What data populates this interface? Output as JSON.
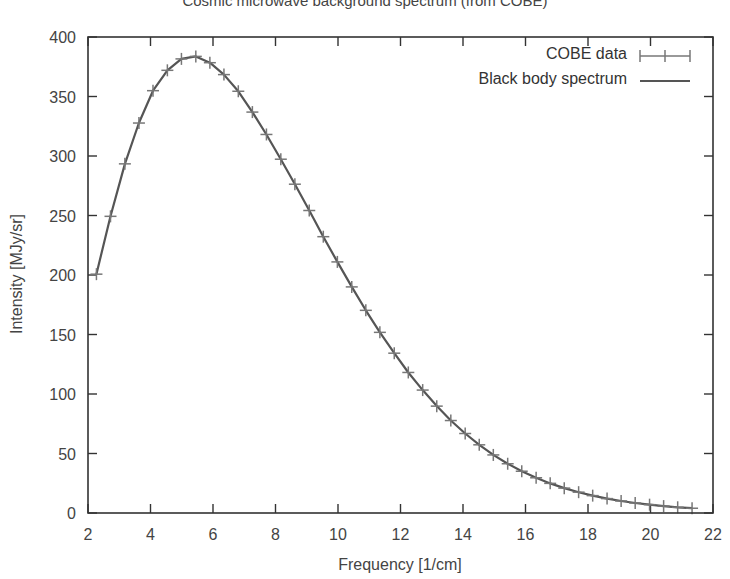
{
  "chart_data": {
    "type": "line",
    "title": "Cosmic microwave background spectrum (from COBE)",
    "xlabel": "Frequency [1/cm]",
    "ylabel": "Intensity [MJy/sr]",
    "xlim": [
      2,
      22
    ],
    "ylim": [
      0,
      400
    ],
    "xticks": [
      2,
      4,
      6,
      8,
      10,
      12,
      14,
      16,
      18,
      20,
      22
    ],
    "yticks": [
      0,
      50,
      100,
      150,
      200,
      250,
      300,
      350,
      400
    ],
    "grid": false,
    "legend_position": "top-right",
    "series": [
      {
        "name": "COBE data",
        "style": "errorbars-crosses",
        "color": "#777777",
        "x": [
          2.27,
          2.72,
          3.18,
          3.63,
          4.08,
          4.54,
          4.99,
          5.45,
          5.9,
          6.35,
          6.81,
          7.26,
          7.71,
          8.17,
          8.62,
          9.08,
          9.53,
          9.98,
          10.44,
          10.89,
          11.34,
          11.8,
          12.25,
          12.71,
          13.16,
          13.61,
          14.07,
          14.52,
          14.97,
          15.43,
          15.88,
          16.34,
          16.79,
          17.24,
          17.7,
          18.15,
          18.61,
          19.06,
          19.51,
          19.97,
          20.42,
          20.87,
          21.33
        ],
        "y": [
          200.7,
          249.3,
          293.4,
          327.7,
          354.9,
          372.0,
          381.6,
          383.7,
          378.4,
          368.4,
          354.4,
          336.9,
          318.1,
          297.3,
          276.3,
          254.2,
          232.2,
          211.0,
          190.0,
          170.3,
          151.8,
          134.3,
          118.1,
          103.3,
          89.8,
          77.7,
          66.8,
          57.3,
          48.8,
          41.4,
          35.1,
          29.6,
          24.9,
          20.9,
          17.5,
          14.6,
          12.1,
          10.1,
          8.4,
          7.0,
          5.8,
          4.8,
          4.0
        ]
      },
      {
        "name": "Black body spectrum",
        "style": "line",
        "color": "#555555",
        "x": [
          2.27,
          2.72,
          3.18,
          3.63,
          4.08,
          4.54,
          4.99,
          5.45,
          5.9,
          6.35,
          6.81,
          7.26,
          7.71,
          8.17,
          8.62,
          9.08,
          9.53,
          9.98,
          10.44,
          10.89,
          11.34,
          11.8,
          12.25,
          12.71,
          13.16,
          13.61,
          14.07,
          14.52,
          14.97,
          15.43,
          15.88,
          16.34,
          16.79,
          17.24,
          17.7,
          18.15,
          18.61,
          19.06,
          19.51,
          19.97,
          20.42,
          20.87,
          21.33
        ],
        "y": [
          200.7,
          249.3,
          293.4,
          327.7,
          354.9,
          372.0,
          381.6,
          383.7,
          378.4,
          368.4,
          354.4,
          336.9,
          318.1,
          297.3,
          276.3,
          254.2,
          232.2,
          211.0,
          190.0,
          170.3,
          151.8,
          134.3,
          118.1,
          103.3,
          89.8,
          77.7,
          66.8,
          57.3,
          48.8,
          41.4,
          35.1,
          29.6,
          24.9,
          20.9,
          17.5,
          14.6,
          12.1,
          10.1,
          8.4,
          7.0,
          5.8,
          4.8,
          4.0
        ]
      }
    ]
  },
  "labels": {
    "title": "Cosmic microwave background spectrum (from COBE)",
    "xlabel": "Frequency [1/cm]",
    "ylabel": "Intensity [MJy/sr]",
    "legend": [
      "COBE data",
      "Black body spectrum"
    ]
  },
  "colors": {
    "axis": "#333333",
    "data": "#777777",
    "curve": "#555555",
    "text": "#333333"
  }
}
